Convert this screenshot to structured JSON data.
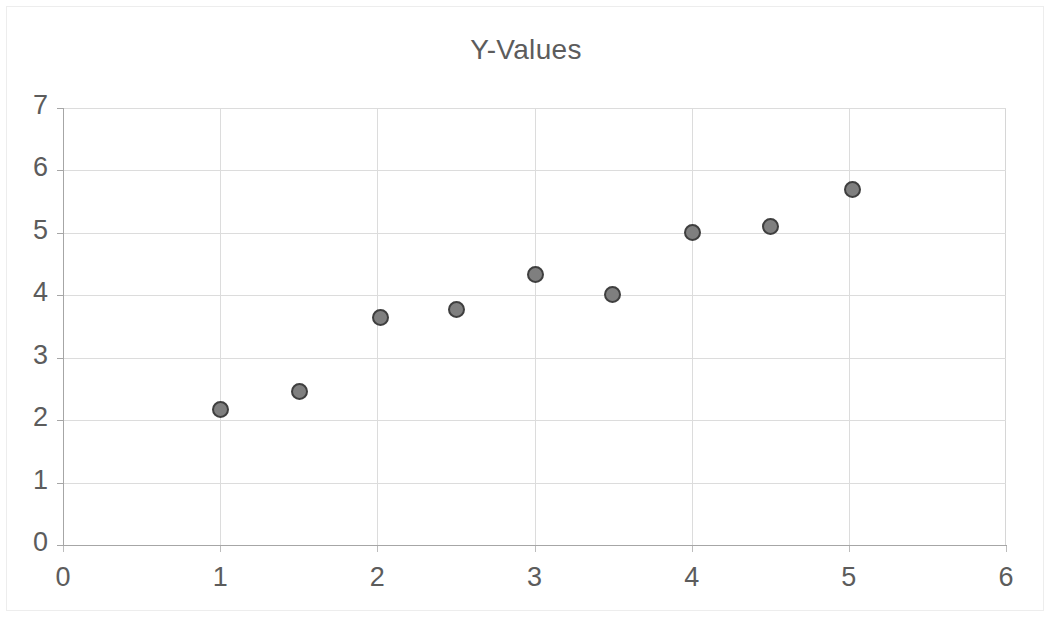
{
  "chart_data": {
    "type": "scatter",
    "title": "Y-Values",
    "xlabel": "",
    "ylabel": "",
    "grid": true,
    "legend": false,
    "legend_position": "none",
    "xlim": [
      0,
      6
    ],
    "ylim": [
      0,
      7
    ],
    "xticks": [
      "0",
      "1",
      "2",
      "3",
      "4",
      "5",
      "6"
    ],
    "yticks": [
      "0",
      "1",
      "2",
      "3",
      "4",
      "5",
      "6",
      "7"
    ],
    "xtick_values": [
      0,
      1,
      2,
      3,
      4,
      5,
      6
    ],
    "ytick_values": [
      0,
      1,
      2,
      3,
      4,
      5,
      6,
      7
    ],
    "series": [
      {
        "name": "Y-Values",
        "marker": "circle",
        "marker_fill": "#7f7f7f",
        "marker_edge": "#3f3f3f",
        "points": [
          {
            "x": 1.0,
            "y": 2.18
          },
          {
            "x": 1.5,
            "y": 2.47
          },
          {
            "x": 2.02,
            "y": 3.65
          },
          {
            "x": 2.5,
            "y": 3.78
          },
          {
            "x": 3.0,
            "y": 4.34
          },
          {
            "x": 3.49,
            "y": 4.02
          },
          {
            "x": 4.0,
            "y": 5.02
          },
          {
            "x": 4.5,
            "y": 5.11
          },
          {
            "x": 5.02,
            "y": 5.71
          }
        ]
      }
    ]
  },
  "colors": {
    "title_text": "#5c5c5c",
    "tick_text": "#5c5c5c",
    "gridline": "#dcdcdc",
    "axis_line": "#a6a6a6",
    "chart_frame": "#ededed",
    "plot_background": "#ffffff",
    "marker_fill": "#7f7f7f",
    "marker_edge": "#3f3f3f"
  }
}
